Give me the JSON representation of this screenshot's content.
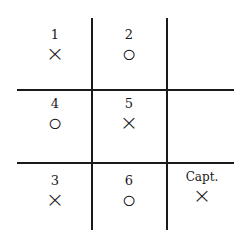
{
  "diagram": {
    "type": "tic-tac-toe grid",
    "cells": [
      {
        "row": 0,
        "col": 0,
        "label": "1",
        "mark": "×"
      },
      {
        "row": 0,
        "col": 1,
        "label": "2",
        "mark": "○"
      },
      {
        "row": 0,
        "col": 2,
        "label": "",
        "mark": ""
      },
      {
        "row": 1,
        "col": 0,
        "label": "4",
        "mark": "○"
      },
      {
        "row": 1,
        "col": 1,
        "label": "5",
        "mark": "×"
      },
      {
        "row": 1,
        "col": 2,
        "label": "",
        "mark": ""
      },
      {
        "row": 2,
        "col": 0,
        "label": "3",
        "mark": "×"
      },
      {
        "row": 2,
        "col": 1,
        "label": "6",
        "mark": "○"
      },
      {
        "row": 2,
        "col": 2,
        "label": "Capt.",
        "mark": "×"
      }
    ]
  }
}
